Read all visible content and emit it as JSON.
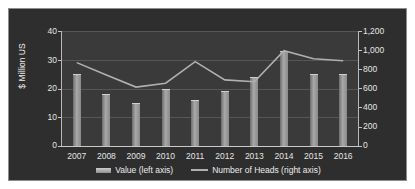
{
  "chart_data": {
    "type": "bar",
    "title": "",
    "subtitle": "",
    "xlabel": "",
    "ylabel": "$ Million US",
    "y2label": "",
    "categories": [
      "2007",
      "2008",
      "2009",
      "2010",
      "2011",
      "2012",
      "2013",
      "2014",
      "2015",
      "2016"
    ],
    "ylim": [
      0,
      40
    ],
    "y2lim": [
      0,
      1200
    ],
    "yticks": [
      "40",
      "30",
      "20",
      "10",
      "0"
    ],
    "y2ticks": [
      "1,200",
      "1,000",
      "800",
      "600",
      "400",
      "200",
      "0"
    ],
    "grid": true,
    "legend_position": "bottom",
    "series": [
      {
        "name": "Value (left axis)",
        "type": "bar",
        "axis": "left",
        "color": "#a8a8a8",
        "values": [
          25,
          18,
          15,
          20,
          16,
          19,
          24,
          33,
          25,
          25
        ]
      },
      {
        "name": "Number of Heads (right axis)",
        "type": "line",
        "axis": "right",
        "color": "#b0b0b0",
        "values": [
          870,
          740,
          615,
          655,
          880,
          690,
          670,
          995,
          910,
          890
        ]
      }
    ]
  },
  "legend": {
    "items": [
      {
        "label": "Value (left axis)",
        "marker": "bar-swatch"
      },
      {
        "label": "Number of Heads (right axis)",
        "marker": "line-swatch"
      }
    ]
  },
  "colors": {
    "frame_background": "#2e2e2e",
    "plot_background": "#3a3a3a",
    "gridline": "#565656",
    "axis": "#c4c4c4",
    "text": "#e4e4e4",
    "bar": "#a8a8a8",
    "line": "#b0b0b0"
  }
}
